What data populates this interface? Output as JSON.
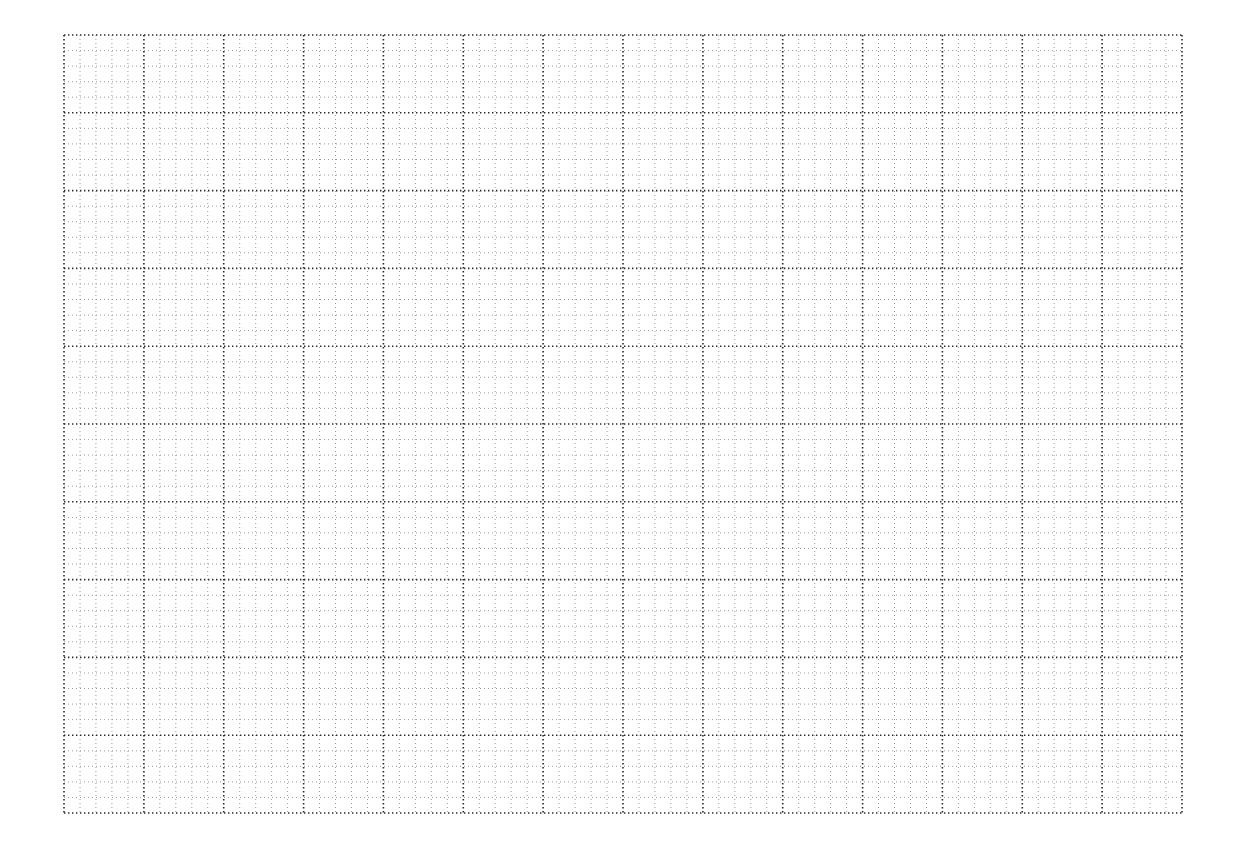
{
  "page": {
    "type": "graph-paper",
    "background": "#ffffff"
  },
  "grid": {
    "left": 64,
    "top": 35,
    "right": 1182,
    "bottom": 813,
    "major_columns": 14,
    "major_rows": 10,
    "minor_per_major": 5,
    "major_color": "#2a2a2a",
    "minor_color": "#9a9a9a",
    "major_dot_pitch": 4,
    "minor_dot_pitch": 4,
    "line_style": "dotted"
  }
}
